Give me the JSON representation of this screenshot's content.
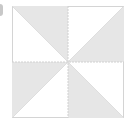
{
  "diagram": {
    "shape": "square-pinwheel",
    "size": 112,
    "colors": {
      "fill": "#e6e6e6",
      "background": "#ffffff",
      "border": "#d4d4d4",
      "dash": "#d0d0d0",
      "edge_tab": "#c8c8c8"
    },
    "shaded_triangles": [
      {
        "name": "top-left",
        "points": "0,0 56,0 56,56"
      },
      {
        "name": "top-right",
        "points": "112,0 112,56 56,56"
      },
      {
        "name": "bottom-left",
        "points": "0,56 56,56 0,112"
      },
      {
        "name": "bottom-right",
        "points": "56,56 56,112 112,112"
      }
    ]
  }
}
